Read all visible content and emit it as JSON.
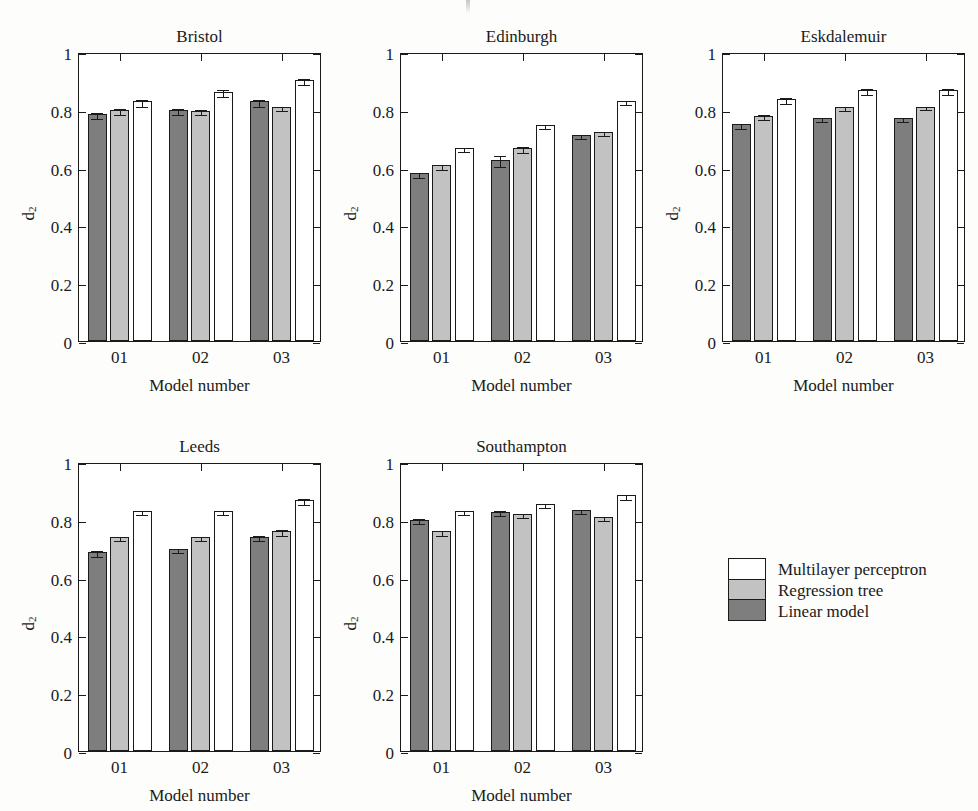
{
  "figure": {
    "panel_count": 5,
    "series_colors": {
      "multilayer_perceptron": "#ffffff",
      "regression_tree": "#c2c2c2",
      "linear_model": "#7e7e7e"
    }
  },
  "axes": {
    "y_label": "d",
    "y_label_sub": "2",
    "x_title": "Model number",
    "y_ticks": [
      "0",
      "0.2",
      "0.4",
      "0.6",
      "0.8",
      "1"
    ],
    "x_ticks": [
      "01",
      "02",
      "03"
    ]
  },
  "legend": {
    "items": [
      {
        "label": "Multilayer perceptron",
        "key": "s-mlp"
      },
      {
        "label": "Regression tree",
        "key": "s-rt"
      },
      {
        "label": "Linear model",
        "key": "s-lm"
      }
    ]
  },
  "panels": [
    {
      "title": "Bristol"
    },
    {
      "title": "Edinburgh"
    },
    {
      "title": "Eskdalemuir"
    },
    {
      "title": "Leeds"
    },
    {
      "title": "Southampton"
    }
  ],
  "chart_data": {
    "type": "bar",
    "title": "",
    "xlabel": "Model number",
    "ylabel": "d2",
    "ylim": [
      0,
      1
    ],
    "yticks": [
      0,
      0.2,
      0.4,
      0.6,
      0.8,
      1
    ],
    "grid": false,
    "legend_position": "bottom-right",
    "categories": [
      "01",
      "02",
      "03"
    ],
    "series_order_in_group": [
      "Linear model",
      "Regression tree",
      "Multilayer perceptron"
    ],
    "error_bars": "standard error (T-caps)",
    "panels": [
      {
        "title": "Bristol",
        "series": [
          {
            "name": "Linear model",
            "values": [
              0.785,
              0.8,
              0.83
            ],
            "errors": [
              0.01,
              0.01,
              0.012
            ]
          },
          {
            "name": "Regression tree",
            "values": [
              0.8,
              0.797,
              0.81
            ],
            "errors": [
              0.01,
              0.008,
              0.008
            ]
          },
          {
            "name": "Multilayer perceptron",
            "values": [
              0.83,
              0.862,
              0.903
            ],
            "errors": [
              0.012,
              0.012,
              0.01
            ]
          }
        ]
      },
      {
        "title": "Edinburgh",
        "series": [
          {
            "name": "Linear model",
            "values": [
              0.58,
              0.628,
              0.713
            ],
            "errors": [
              0.008,
              0.018,
              0.008
            ]
          },
          {
            "name": "Regression tree",
            "values": [
              0.608,
              0.668,
              0.722
            ],
            "errors": [
              0.008,
              0.01,
              0.007
            ]
          },
          {
            "name": "Multilayer perceptron",
            "values": [
              0.668,
              0.748,
              0.83
            ],
            "errors": [
              0.008,
              0.008,
              0.008
            ]
          }
        ]
      },
      {
        "title": "Eskdalemuir",
        "series": [
          {
            "name": "Linear model",
            "values": [
              0.75,
              0.772,
              0.772
            ],
            "errors": [
              0.008,
              0.006,
              0.006
            ]
          },
          {
            "name": "Regression tree",
            "values": [
              0.78,
              0.81,
              0.81
            ],
            "errors": [
              0.008,
              0.008,
              0.005
            ]
          },
          {
            "name": "Multilayer perceptron",
            "values": [
              0.838,
              0.868,
              0.868
            ],
            "errors": [
              0.01,
              0.01,
              0.01
            ]
          }
        ]
      },
      {
        "title": "Leeds",
        "series": [
          {
            "name": "Linear model",
            "values": [
              0.688,
              0.7,
              0.742
            ],
            "errors": [
              0.01,
              0.007,
              0.01
            ]
          },
          {
            "name": "Regression tree",
            "values": [
              0.74,
              0.74,
              0.76
            ],
            "errors": [
              0.007,
              0.007,
              0.01
            ]
          },
          {
            "name": "Multilayer perceptron",
            "values": [
              0.83,
              0.83,
              0.868
            ],
            "errors": [
              0.008,
              0.008,
              0.01
            ]
          }
        ]
      },
      {
        "title": "Southampton",
        "series": [
          {
            "name": "Linear model",
            "values": [
              0.8,
              0.828,
              0.835
            ],
            "errors": [
              0.008,
              0.008,
              0.007
            ]
          },
          {
            "name": "Regression tree",
            "values": [
              0.76,
              0.82,
              0.81
            ],
            "errors": [
              0.008,
              0.006,
              0.007
            ]
          },
          {
            "name": "Multilayer perceptron",
            "values": [
              0.83,
              0.855,
              0.885
            ],
            "errors": [
              0.008,
              0.008,
              0.008
            ]
          }
        ]
      }
    ]
  }
}
